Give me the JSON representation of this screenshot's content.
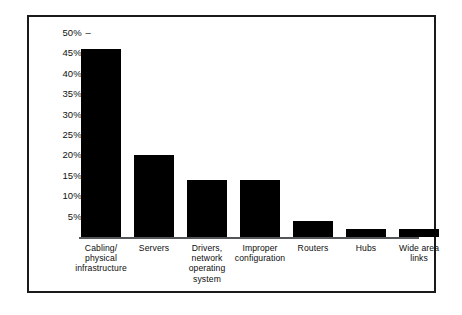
{
  "chart_data": {
    "type": "bar",
    "title": "",
    "subtitle": "",
    "xlabel": "",
    "ylabel": "",
    "ylim": [
      0,
      52
    ],
    "grid": false,
    "legend": null,
    "orientation": "vertical",
    "bar_color": "#000000",
    "categories": [
      "Cabling/ physical infrastructure",
      "Servers",
      "Drivers, network operating system",
      "Improper configuration",
      "Routers",
      "Hubs",
      "Wide area links"
    ],
    "category_lines": [
      [
        "Cabling/",
        "physical",
        "infrastructure"
      ],
      [
        "Servers"
      ],
      [
        "Drivers,",
        "network",
        "operating",
        "system"
      ],
      [
        "Improper",
        "configuration"
      ],
      [
        "Routers"
      ],
      [
        "Hubs"
      ],
      [
        "Wide area",
        "links"
      ]
    ],
    "values": [
      46,
      20,
      14,
      14,
      4,
      2,
      2
    ],
    "ytick_values": [
      50,
      45,
      40,
      35,
      30,
      25,
      20,
      15,
      10,
      5
    ],
    "ytick_labels": [
      "50%",
      "45%",
      "40%",
      "35%",
      "30%",
      "25%",
      "20%",
      "15%",
      "10%",
      "5%"
    ],
    "tick_mark": "–"
  },
  "frame": {
    "border_color": "#1a1a1a",
    "background": "#ffffff",
    "baseline_color": "#55565a"
  }
}
